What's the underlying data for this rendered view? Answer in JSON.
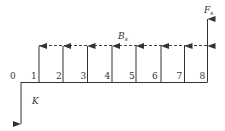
{
  "diagram": {
    "type": "cash-flow-diagram",
    "periods": [
      "0",
      "1",
      "2",
      "3",
      "4",
      "5",
      "6",
      "7",
      "8"
    ],
    "labels": {
      "annual_benefit": "B",
      "annual_benefit_sub": "s",
      "final_value": "F",
      "final_value_sub": "s",
      "investment": "K"
    },
    "colors": {
      "line": "#333333",
      "dash": "#444444"
    }
  }
}
